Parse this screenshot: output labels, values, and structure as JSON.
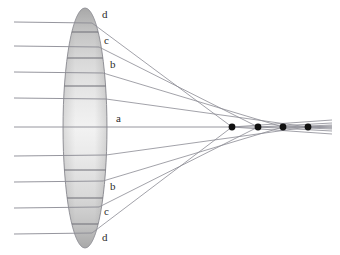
{
  "figure": {
    "name": "spherical-aberration-lens-diagram",
    "type": "optics-ray-diagram",
    "width": 340,
    "height": 255,
    "background": "#ffffff"
  },
  "colors": {
    "ray": "#8a8a93",
    "axis": "#8a8a93",
    "focal_point": "#111111",
    "lens_outline": "#8e8e95",
    "label_text": "#2b2b2b",
    "zone_a": "#f0f0f0",
    "zone_a_mid": "#e6e6e6",
    "zone_b": "#d9d9d9",
    "zone_c": "#c4c4c4",
    "zone_d": "#a8a8a8",
    "zone_divider": "#6f6f76"
  },
  "lens": {
    "name": "biconvex-lens",
    "center_x": 85,
    "center_y": 128,
    "semi_width": 22,
    "semi_height": 120,
    "top_y": 8,
    "bottom_y": 248
  },
  "optical_axis": {
    "y": 127,
    "x_start": 14,
    "x_end": 332
  },
  "zone_labels": [
    {
      "text": "d",
      "x": 102,
      "y": 18,
      "zone": "d",
      "half": "upper"
    },
    {
      "text": "c",
      "x": 104,
      "y": 44,
      "zone": "c",
      "half": "upper"
    },
    {
      "text": "b",
      "x": 110,
      "y": 68,
      "zone": "b",
      "half": "upper"
    },
    {
      "text": "a",
      "x": 116,
      "y": 122,
      "zone": "a",
      "half": "upper"
    },
    {
      "text": "b",
      "x": 110,
      "y": 190,
      "zone": "b",
      "half": "lower"
    },
    {
      "text": "c",
      "x": 104,
      "y": 215,
      "zone": "c",
      "half": "lower"
    },
    {
      "text": "d",
      "x": 102,
      "y": 241,
      "zone": "d",
      "half": "lower"
    }
  ],
  "incoming_rays": [
    {
      "id": "ray-d-upper",
      "zone": "d",
      "y": 22,
      "x_start": 14
    },
    {
      "id": "ray-c-upper",
      "zone": "c",
      "y": 46,
      "x_start": 14
    },
    {
      "id": "ray-b-upper",
      "zone": "b",
      "y": 72,
      "x_start": 14
    },
    {
      "id": "ray-a-upper",
      "zone": "a",
      "y": 98,
      "x_start": 14
    },
    {
      "id": "ray-axis",
      "zone": "axis",
      "y": 127,
      "x_start": 14
    },
    {
      "id": "ray-a-lower",
      "zone": "a",
      "y": 156,
      "x_start": 14
    },
    {
      "id": "ray-b-lower",
      "zone": "b",
      "y": 182,
      "x_start": 14
    },
    {
      "id": "ray-c-lower",
      "zone": "c",
      "y": 208,
      "x_start": 14
    },
    {
      "id": "ray-d-lower",
      "zone": "d",
      "y": 234,
      "x_start": 14
    }
  ],
  "focal_points": [
    {
      "id": "focus-d",
      "zone": "d",
      "x": 232,
      "y": 127,
      "r": 3.4
    },
    {
      "id": "focus-c",
      "zone": "c",
      "x": 258,
      "y": 127,
      "r": 3.4
    },
    {
      "id": "focus-b",
      "zone": "b",
      "x": 283,
      "y": 127,
      "r": 3.4
    },
    {
      "id": "focus-a",
      "zone": "a",
      "x": 308,
      "y": 127,
      "r": 3.4
    }
  ],
  "refracted_rays": [
    {
      "id": "refract-d-upper",
      "zone": "d",
      "exit_x": 92,
      "exit_y": 23,
      "focus_x": 232,
      "tail_x": 332
    },
    {
      "id": "refract-c-upper",
      "zone": "c",
      "exit_x": 99,
      "exit_y": 47,
      "focus_x": 258,
      "tail_x": 332
    },
    {
      "id": "refract-b-upper",
      "zone": "b",
      "exit_x": 103,
      "exit_y": 73,
      "focus_x": 283,
      "tail_x": 332
    },
    {
      "id": "refract-a-upper",
      "zone": "a",
      "exit_x": 106,
      "exit_y": 99,
      "focus_x": 308,
      "tail_x": 332
    },
    {
      "id": "refract-a-lower",
      "zone": "a",
      "exit_x": 106,
      "exit_y": 155,
      "focus_x": 308,
      "tail_x": 332
    },
    {
      "id": "refract-b-lower",
      "zone": "b",
      "exit_x": 103,
      "exit_y": 181,
      "focus_x": 283,
      "tail_x": 332
    },
    {
      "id": "refract-c-lower",
      "zone": "c",
      "exit_x": 99,
      "exit_y": 207,
      "focus_x": 258,
      "tail_x": 332
    },
    {
      "id": "refract-d-lower",
      "zone": "d",
      "exit_x": 92,
      "exit_y": 233,
      "focus_x": 232,
      "tail_x": 332
    }
  ],
  "zone_dividers": [
    {
      "id": "divider-upper-d",
      "y": 32
    },
    {
      "id": "divider-upper-c",
      "y": 58
    },
    {
      "id": "divider-upper-b",
      "y": 86
    },
    {
      "id": "divider-lower-b",
      "y": 170
    },
    {
      "id": "divider-lower-c",
      "y": 198
    },
    {
      "id": "divider-lower-d",
      "y": 224
    }
  ]
}
